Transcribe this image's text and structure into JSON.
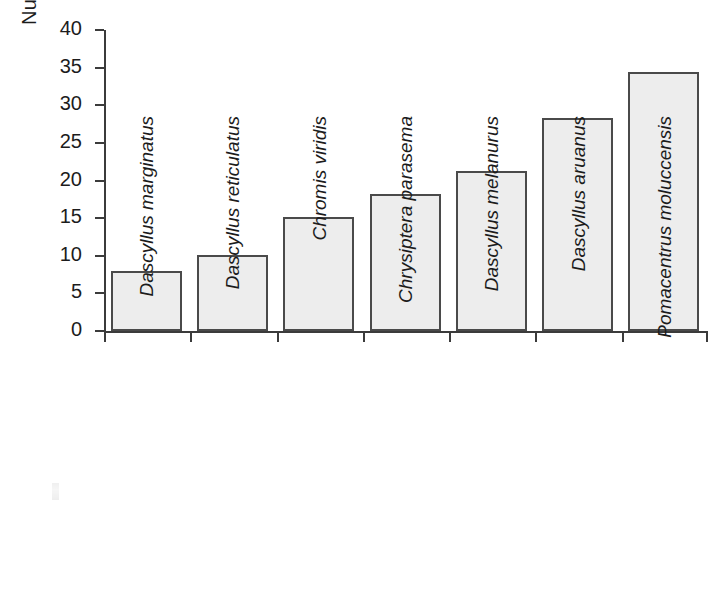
{
  "chart_data": {
    "type": "bar",
    "title": "",
    "xlabel": "",
    "ylabel": "Number of host coral species",
    "ylim": [
      0,
      40
    ],
    "ytick_step": 5,
    "yticks": [
      0,
      5,
      10,
      15,
      20,
      25,
      30,
      35,
      40
    ],
    "ytick_labels": [
      "0",
      "5",
      "10",
      "15",
      "20",
      "25",
      "30",
      "35",
      "40"
    ],
    "grid": false,
    "legend": null,
    "categories": [
      "Dascyllus marginatus",
      "Dascyllus reticulatus",
      "Chromis viridis",
      "Chrysiptera parasema",
      "Dascyllus melanurus",
      "Dascyllus aruanus",
      "Pomacentrus moluccensis"
    ],
    "values": [
      8.0,
      10.1,
      15.2,
      18.2,
      21.3,
      28.3,
      34.4
    ],
    "bar_fill_color": "#ededed",
    "bar_edge_color": "#4a4a4a",
    "axis_color": "#3b3b3b",
    "background_color": "#ffffff",
    "category_label_style": "italic-rotated-90"
  }
}
